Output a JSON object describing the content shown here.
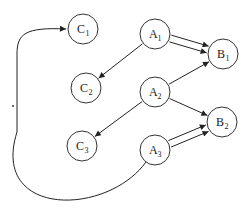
{
  "diagram": {
    "nodes": [
      {
        "id": "C1",
        "letter": "C",
        "sub": "1",
        "x": 83,
        "y": 29
      },
      {
        "id": "C2",
        "letter": "C",
        "sub": "2",
        "x": 86,
        "y": 88
      },
      {
        "id": "C3",
        "letter": "C",
        "sub": "3",
        "x": 82,
        "y": 146
      },
      {
        "id": "A1",
        "letter": "A",
        "sub": "1",
        "x": 155,
        "y": 34
      },
      {
        "id": "A2",
        "letter": "A",
        "sub": "2",
        "x": 155,
        "y": 92
      },
      {
        "id": "A3",
        "letter": "A",
        "sub": "3",
        "x": 155,
        "y": 150
      },
      {
        "id": "B1",
        "letter": "B",
        "sub": "1",
        "x": 223,
        "y": 54
      },
      {
        "id": "B2",
        "letter": "B",
        "sub": "2",
        "x": 222,
        "y": 122
      }
    ],
    "edges": [
      {
        "from": "A1",
        "to": "C2"
      },
      {
        "from": "A1",
        "to": "B1",
        "parallel": 1
      },
      {
        "from": "A1",
        "to": "B1",
        "parallel": 2
      },
      {
        "from": "A2",
        "to": "B1"
      },
      {
        "from": "A2",
        "to": "C3"
      },
      {
        "from": "A2",
        "to": "B2"
      },
      {
        "from": "A3",
        "to": "B2",
        "parallel": 1
      },
      {
        "from": "A3",
        "to": "B2",
        "parallel": 2
      },
      {
        "from": "A3",
        "to": "C1",
        "curved": true
      }
    ],
    "node_radius": 15,
    "stroke_color": "#222222"
  }
}
